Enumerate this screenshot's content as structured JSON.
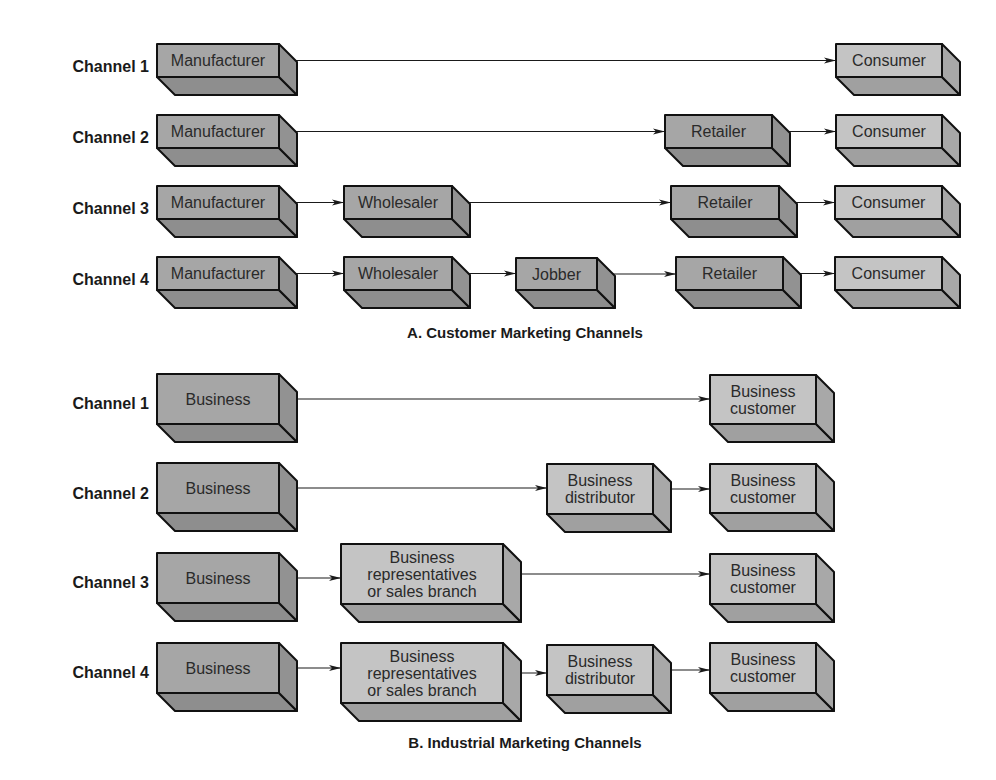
{
  "colors": {
    "dark_front": "#a6a6a6",
    "dark_side": "#929292",
    "dark_bottom": "#8e8e8e",
    "light_front": "#c4c4c4",
    "light_side": "#a8a8a8",
    "light_bottom": "#a0a0a0",
    "outline": "#111111",
    "text": "#2a2a2a"
  },
  "sections": [
    {
      "id": "consumer",
      "caption": "A. Customer Marketing Channels",
      "caption_pos": [
        525,
        338
      ],
      "channels": [
        {
          "label": "Channel 1",
          "label_y": 66,
          "nodes": [
            {
              "id": "c1-manufacturer",
              "lines": [
                "Manufacturer"
              ],
              "x": 157,
              "y": 44,
              "w": 122,
              "h": 33,
              "tone": "dark"
            },
            {
              "id": "c1-consumer",
              "lines": [
                "Consumer"
              ],
              "x": 836,
              "y": 44,
              "w": 106,
              "h": 33,
              "tone": "light"
            }
          ]
        },
        {
          "label": "Channel 2",
          "label_y": 137,
          "nodes": [
            {
              "id": "c2-manufacturer",
              "lines": [
                "Manufacturer"
              ],
              "x": 157,
              "y": 115,
              "w": 122,
              "h": 33,
              "tone": "dark"
            },
            {
              "id": "c2-retailer",
              "lines": [
                "Retailer"
              ],
              "x": 665,
              "y": 115,
              "w": 107,
              "h": 33,
              "tone": "dark"
            },
            {
              "id": "c2-consumer",
              "lines": [
                "Consumer"
              ],
              "x": 836,
              "y": 115,
              "w": 106,
              "h": 33,
              "tone": "light"
            }
          ]
        },
        {
          "label": "Channel 3",
          "label_y": 208,
          "nodes": [
            {
              "id": "c3-manufacturer",
              "lines": [
                "Manufacturer"
              ],
              "x": 157,
              "y": 186,
              "w": 122,
              "h": 33,
              "tone": "dark"
            },
            {
              "id": "c3-wholesaler",
              "lines": [
                "Wholesaler"
              ],
              "x": 344,
              "y": 186,
              "w": 108,
              "h": 33,
              "tone": "dark"
            },
            {
              "id": "c3-retailer",
              "lines": [
                "Retailer"
              ],
              "x": 671,
              "y": 186,
              "w": 108,
              "h": 33,
              "tone": "dark"
            },
            {
              "id": "c3-consumer",
              "lines": [
                "Consumer"
              ],
              "x": 835,
              "y": 186,
              "w": 107,
              "h": 33,
              "tone": "light"
            }
          ]
        },
        {
          "label": "Channel 4",
          "label_y": 279,
          "nodes": [
            {
              "id": "c4-manufacturer",
              "lines": [
                "Manufacturer"
              ],
              "x": 157,
              "y": 257,
              "w": 122,
              "h": 33,
              "tone": "dark"
            },
            {
              "id": "c4-wholesaler",
              "lines": [
                "Wholesaler"
              ],
              "x": 344,
              "y": 257,
              "w": 108,
              "h": 33,
              "tone": "dark"
            },
            {
              "id": "c4-jobber",
              "lines": [
                "Jobber"
              ],
              "x": 516,
              "y": 258,
              "w": 81,
              "h": 32,
              "tone": "dark"
            },
            {
              "id": "c4-retailer",
              "lines": [
                "Retailer"
              ],
              "x": 676,
              "y": 257,
              "w": 107,
              "h": 33,
              "tone": "dark"
            },
            {
              "id": "c4-consumer",
              "lines": [
                "Consumer"
              ],
              "x": 835,
              "y": 257,
              "w": 107,
              "h": 33,
              "tone": "light"
            }
          ]
        }
      ]
    },
    {
      "id": "industrial",
      "caption": "B. Industrial Marketing Channels",
      "caption_pos": [
        525,
        748
      ],
      "channels": [
        {
          "label": "Channel 1",
          "label_y": 403,
          "nodes": [
            {
              "id": "i1-business",
              "lines": [
                "Business"
              ],
              "x": 157,
              "y": 374,
              "w": 122,
              "h": 50,
              "tone": "dark"
            },
            {
              "id": "i1-customer",
              "lines": [
                "Business",
                "customer"
              ],
              "x": 710,
              "y": 375,
              "w": 106,
              "h": 49,
              "tone": "light"
            }
          ]
        },
        {
          "label": "Channel 2",
          "label_y": 493,
          "nodes": [
            {
              "id": "i2-business",
              "lines": [
                "Business"
              ],
              "x": 157,
              "y": 463,
              "w": 122,
              "h": 50,
              "tone": "dark"
            },
            {
              "id": "i2-distributor",
              "lines": [
                "Business",
                "distributor"
              ],
              "x": 547,
              "y": 464,
              "w": 106,
              "h": 50,
              "tone": "light"
            },
            {
              "id": "i2-customer",
              "lines": [
                "Business",
                "customer"
              ],
              "x": 710,
              "y": 464,
              "w": 106,
              "h": 49,
              "tone": "light"
            }
          ]
        },
        {
          "label": "Channel 3",
          "label_y": 582,
          "nodes": [
            {
              "id": "i3-business",
              "lines": [
                "Business"
              ],
              "x": 157,
              "y": 553,
              "w": 122,
              "h": 50,
              "tone": "dark"
            },
            {
              "id": "i3-representatives",
              "lines": [
                "Business",
                "representatives",
                "or sales branch"
              ],
              "x": 341,
              "y": 544,
              "w": 162,
              "h": 60,
              "tone": "light"
            },
            {
              "id": "i3-customer",
              "lines": [
                "Business",
                "customer"
              ],
              "x": 710,
              "y": 554,
              "w": 106,
              "h": 50,
              "tone": "light"
            }
          ]
        },
        {
          "label": "Channel 4",
          "label_y": 672,
          "nodes": [
            {
              "id": "i4-business",
              "lines": [
                "Business"
              ],
              "x": 157,
              "y": 643,
              "w": 122,
              "h": 50,
              "tone": "dark"
            },
            {
              "id": "i4-representatives",
              "lines": [
                "Business",
                "representatives",
                "or sales branch"
              ],
              "x": 341,
              "y": 643,
              "w": 162,
              "h": 60,
              "tone": "light"
            },
            {
              "id": "i4-distributor",
              "lines": [
                "Business",
                "distributor"
              ],
              "x": 547,
              "y": 645,
              "w": 106,
              "h": 50,
              "tone": "light"
            },
            {
              "id": "i4-customer",
              "lines": [
                "Business",
                "customer"
              ],
              "x": 710,
              "y": 643,
              "w": 106,
              "h": 50,
              "tone": "light"
            }
          ]
        }
      ]
    }
  ],
  "depth": {
    "dx": 18,
    "dy": 18
  }
}
